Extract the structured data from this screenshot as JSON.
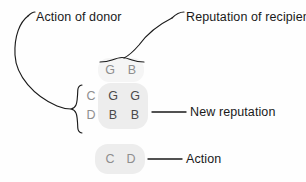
{
  "diagram": {
    "annotations": {
      "action_of_donor": "Action of donor",
      "reputation_of_recipient": "Reputation of recipient",
      "new_reputation": "New reputation",
      "action": "Action"
    },
    "matrix": {
      "column_headers": [
        "G",
        "B"
      ],
      "row_labels": [
        "C",
        "D"
      ],
      "cells": [
        [
          "G",
          "G"
        ],
        [
          "B",
          "B"
        ]
      ]
    },
    "action_row": {
      "values": [
        "C",
        "D"
      ]
    },
    "colors": {
      "background": "#fefefe",
      "stroke": "#1a1a1a",
      "text": "#1a1a1a",
      "glyph_light": "#8e8e8e",
      "glyph_dark": "#4a4a4a",
      "highlight": "#ededed"
    }
  }
}
